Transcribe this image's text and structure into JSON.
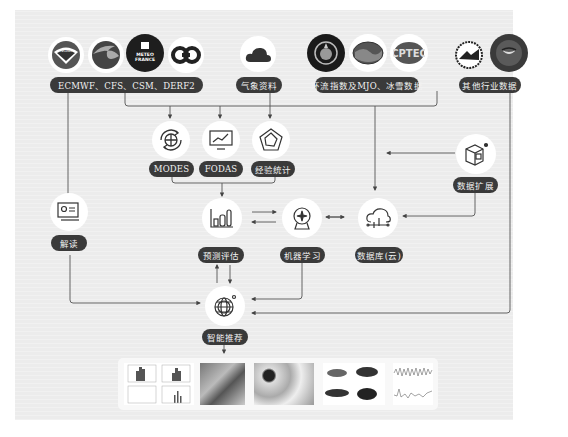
{
  "sources": {
    "group1": {
      "label": "ECMWF、CFS、CSM、DERF2",
      "logos": [
        "noaa-logo",
        "ecmwf-logo",
        "meteo-france-logo",
        "ecmwf-style-logo"
      ],
      "meteo_france_text": "METEO FRANCE"
    },
    "group2": {
      "label": "气象资料",
      "logos": [
        "cloud-logo"
      ]
    },
    "group3": {
      "label": "环流指数及MJO、冰雪数据",
      "logos": [
        "wmo-logo",
        "ocean-logo",
        "cptec-logo"
      ],
      "cptec_text": "CPTEC"
    },
    "group4": {
      "label": "其他行业数据",
      "logos": [
        "weather-service-logo",
        "nasa-style-logo"
      ]
    }
  },
  "models": [
    {
      "label": "MODES",
      "icon": "cycle-icon"
    },
    {
      "label": "FODAS",
      "icon": "monitor-chart-icon"
    },
    {
      "label": "经验统计",
      "icon": "pentagon-radar-icon"
    }
  ],
  "nodes": {
    "interpret": {
      "label": "解读",
      "icon": "presentation-icon"
    },
    "evaluate": {
      "label": "预测评估",
      "icon": "bar-chart-icon"
    },
    "ml": {
      "label": "机器学习",
      "icon": "robot-icon"
    },
    "db": {
      "label": "数据库(云)",
      "icon": "cloud-db-icon"
    },
    "expand": {
      "label": "数据扩展",
      "icon": "cube-icon"
    },
    "recommend": {
      "label": "智能推荐",
      "icon": "globe-icon"
    }
  },
  "output_gallery": [
    "histogram-panels",
    "terrain-map",
    "contour-map",
    "regional-maps",
    "time-series"
  ],
  "colors": {
    "pill_bg": "#3a3a3a",
    "pill_text": "#f2f2f2",
    "panel_bg": "#ececec",
    "line": "#555555"
  }
}
